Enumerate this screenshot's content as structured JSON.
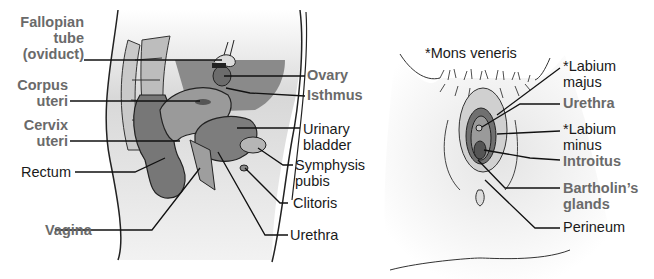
{
  "colors": {
    "bold_label": "#6a6a6a",
    "regular_label": "#1a1a1a",
    "tissue_dark": "#707070",
    "tissue_mid": "#a8a8a8",
    "tissue_light": "#e2e2e2"
  },
  "left_figure": {
    "title": "Sagittal section of female pelvis",
    "labels": {
      "fallopian_1": "Fallopian",
      "fallopian_2": "tube",
      "fallopian_3": "(oviduct)",
      "corpus_1": "Corpus",
      "corpus_2": "uteri",
      "cervix_1": "Cervix",
      "cervix_2": "uteri",
      "rectum": "Rectum",
      "vagina": "Vagina",
      "ovary": "Ovary",
      "isthmus": "Isthmus",
      "bladder_1": "Urinary",
      "bladder_2": "bladder",
      "symphysis_1": "Symphysis",
      "symphysis_2": "pubis",
      "clitoris": "Clitoris",
      "urethra": "Urethra"
    }
  },
  "right_figure": {
    "title": "External female genitalia",
    "labels": {
      "mons": "*Mons veneris",
      "labium_majus_1": "*Labium",
      "labium_majus_2": "majus",
      "urethra": "Urethra",
      "labium_minus_1": "*Labium",
      "labium_minus_2": "minus",
      "introitus": "Introitus",
      "bartholin_1": "Bartholin’s",
      "bartholin_2": "glands",
      "perineum": "Perineum"
    }
  }
}
